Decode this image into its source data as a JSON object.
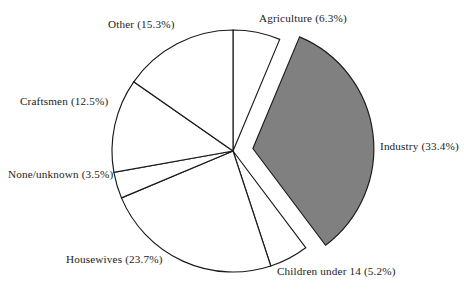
{
  "chart_data": {
    "type": "pie",
    "title": "",
    "subtitle": "",
    "xlabel": "",
    "ylabel": "",
    "legend_position": "none",
    "grid": false,
    "labels_format": "{name} ({value}%)",
    "start_angle_deg": 0,
    "direction": "clockwise",
    "categories": [
      "Agriculture",
      "Industry",
      "Children under 14",
      "Housewives",
      "None/unknown",
      "Craftsmen",
      "Other"
    ],
    "values": [
      6.3,
      33.4,
      5.2,
      23.7,
      3.5,
      12.5,
      15.3
    ],
    "total": 99.9,
    "slices": [
      {
        "name": "Agriculture",
        "value": 6.3,
        "label": "Agriculture (6.3%)",
        "fill": "#ffffff",
        "stroke": "#1a1a1a",
        "exploded": false
      },
      {
        "name": "Industry",
        "value": 33.4,
        "label": "Industry (33.4%)",
        "fill": "#808080",
        "stroke": "#1a1a1a",
        "exploded": true
      },
      {
        "name": "Children under 14",
        "value": 5.2,
        "label": "Children under 14 (5.2%)",
        "fill": "#ffffff",
        "stroke": "#1a1a1a",
        "exploded": false
      },
      {
        "name": "Housewives",
        "value": 23.7,
        "label": "Housewives (23.7%)",
        "fill": "#ffffff",
        "stroke": "#1a1a1a",
        "exploded": false
      },
      {
        "name": "None/unknown",
        "value": 3.5,
        "label": "None/unknown (3.5%)",
        "fill": "#ffffff",
        "stroke": "#1a1a1a",
        "exploded": false
      },
      {
        "name": "Craftsmen",
        "value": 12.5,
        "label": "Craftsmen (12.5%)",
        "fill": "#ffffff",
        "stroke": "#1a1a1a",
        "exploded": false
      },
      {
        "name": "Other",
        "value": 15.3,
        "label": "Other (15.3%)",
        "fill": "#ffffff",
        "stroke": "#1a1a1a",
        "exploded": false
      }
    ],
    "geometry": {
      "center_x": 233,
      "center_y": 151,
      "radius": 121,
      "explode_offset": 20
    },
    "colors": {
      "background": "#ffffff",
      "highlight_fill": "#808080",
      "outline": "#1a1a1a",
      "text": "#1c1c1c"
    }
  }
}
